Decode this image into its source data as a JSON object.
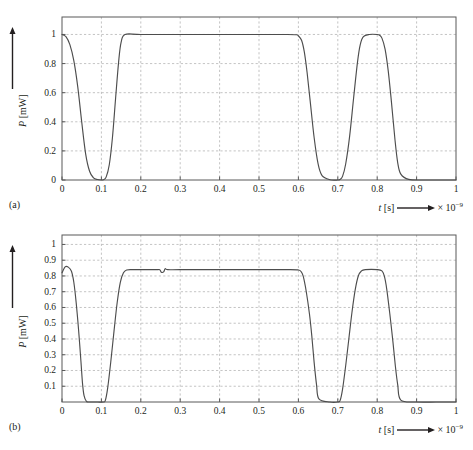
{
  "figure": {
    "background": "#ffffff",
    "line_color": "#4d4d4d",
    "axis_color": "#595959",
    "grid_color": "#aaaaaa"
  },
  "panels": [
    {
      "tag": "(a)",
      "xlabel_var": "t",
      "xlabel_unit": "[s]",
      "xlabel_scale_prefix": "× 10",
      "xlabel_scale_exp": "−9",
      "ylabel_var": "P",
      "ylabel_unit": "[mW]",
      "x_ticks": [
        "0",
        "0.1",
        "0.2",
        "0.3",
        "0.4",
        "0.5",
        "0.6",
        "0.7",
        "0.8",
        "0.9",
        "1"
      ],
      "y_ticks": [
        "0",
        "0.2",
        "0.4",
        "0.6",
        "0.8",
        "1"
      ]
    },
    {
      "tag": "(b)",
      "xlabel_var": "t",
      "xlabel_unit": "[s]",
      "xlabel_scale_prefix": "× 10",
      "xlabel_scale_exp": "−9",
      "ylabel_var": "P",
      "ylabel_unit": "[mW]",
      "x_ticks": [
        "0",
        "0.1",
        "0.2",
        "0.3",
        "0.4",
        "0.5",
        "0.6",
        "0.7",
        "0.8",
        "0.9",
        "1"
      ],
      "y_ticks": [
        "0.1",
        "0.2",
        "0.3",
        "0.4",
        "0.5",
        "0.6",
        "0.7",
        "0.8",
        "0.9",
        "1"
      ]
    }
  ],
  "chart_data": [
    {
      "type": "line",
      "title": "",
      "panel": "(a)",
      "xlabel": "t [s] × 10^-9",
      "ylabel": "P [mW]",
      "xlim": [
        0,
        1
      ],
      "ylim": [
        0,
        1.12
      ],
      "x_tick_values": [
        0,
        0.1,
        0.2,
        0.3,
        0.4,
        0.5,
        0.6,
        0.7,
        0.8,
        0.9,
        1
      ],
      "y_tick_values": [
        0,
        0.2,
        0.4,
        0.6,
        0.8,
        1
      ],
      "grid": true,
      "legend": "none",
      "series": [
        {
          "name": "optical power (a)",
          "x": [
            0.0,
            0.01,
            0.02,
            0.03,
            0.04,
            0.05,
            0.06,
            0.07,
            0.08,
            0.09,
            0.1,
            0.105,
            0.112,
            0.12,
            0.128,
            0.136,
            0.144,
            0.15,
            0.16,
            0.2,
            0.3,
            0.4,
            0.5,
            0.57,
            0.595,
            0.6,
            0.608,
            0.615,
            0.622,
            0.63,
            0.64,
            0.65,
            0.66,
            0.68,
            0.7,
            0.705,
            0.712,
            0.72,
            0.73,
            0.74,
            0.75,
            0.757,
            0.765,
            0.78,
            0.8,
            0.806,
            0.812,
            0.82,
            0.828,
            0.836,
            0.845,
            0.852,
            0.86,
            0.88,
            0.92,
            0.96,
            1.0
          ],
          "y": [
            1.0,
            0.985,
            0.93,
            0.82,
            0.64,
            0.4,
            0.18,
            0.06,
            0.015,
            0.003,
            0.0,
            0.002,
            0.02,
            0.105,
            0.29,
            0.56,
            0.82,
            0.945,
            1.0,
            1.0,
            1.0,
            1.0,
            1.0,
            1.0,
            0.998,
            0.99,
            0.96,
            0.88,
            0.74,
            0.54,
            0.29,
            0.11,
            0.03,
            0.002,
            0.0,
            0.003,
            0.025,
            0.11,
            0.3,
            0.56,
            0.81,
            0.93,
            0.985,
            1.0,
            1.0,
            0.995,
            0.975,
            0.9,
            0.75,
            0.54,
            0.28,
            0.12,
            0.04,
            0.004,
            0.0,
            0.0,
            0.0
          ]
        }
      ]
    },
    {
      "type": "line",
      "title": "",
      "panel": "(b)",
      "xlabel": "t [s] × 10^-9",
      "ylabel": "P [mW]",
      "xlim": [
        0,
        1
      ],
      "ylim": [
        0,
        1.06
      ],
      "x_tick_values": [
        0,
        0.1,
        0.2,
        0.3,
        0.4,
        0.5,
        0.6,
        0.7,
        0.8,
        0.9,
        1
      ],
      "y_tick_values": [
        0.1,
        0.2,
        0.3,
        0.4,
        0.5,
        0.6,
        0.7,
        0.8,
        0.9,
        1
      ],
      "grid": true,
      "legend": "none",
      "plateau_level": 0.84,
      "initial_overshoot": 0.86,
      "glitch_at_x": 0.25,
      "series": [
        {
          "name": "optical power (b)",
          "x": [
            0.0,
            0.008,
            0.016,
            0.024,
            0.03,
            0.036,
            0.042,
            0.048,
            0.052,
            0.056,
            0.062,
            0.07,
            0.09,
            0.105,
            0.11,
            0.116,
            0.124,
            0.132,
            0.14,
            0.148,
            0.156,
            0.164,
            0.18,
            0.2,
            0.24,
            0.248,
            0.252,
            0.258,
            0.262,
            0.268,
            0.3,
            0.4,
            0.5,
            0.58,
            0.6,
            0.606,
            0.612,
            0.62,
            0.628,
            0.634,
            0.64,
            0.646,
            0.652,
            0.68,
            0.7,
            0.706,
            0.712,
            0.72,
            0.728,
            0.736,
            0.744,
            0.752,
            0.76,
            0.77,
            0.8,
            0.812,
            0.818,
            0.824,
            0.832,
            0.84,
            0.846,
            0.852,
            0.86,
            0.9,
            0.95,
            1.0
          ],
          "y": [
            0.82,
            0.858,
            0.856,
            0.83,
            0.76,
            0.63,
            0.46,
            0.26,
            0.12,
            0.04,
            0.004,
            0.0,
            0.0,
            0.0,
            0.01,
            0.09,
            0.26,
            0.45,
            0.63,
            0.76,
            0.82,
            0.838,
            0.84,
            0.84,
            0.84,
            0.84,
            0.824,
            0.826,
            0.846,
            0.84,
            0.84,
            0.84,
            0.84,
            0.84,
            0.838,
            0.83,
            0.8,
            0.7,
            0.56,
            0.42,
            0.25,
            0.11,
            0.02,
            0.0,
            0.0,
            0.01,
            0.08,
            0.23,
            0.4,
            0.57,
            0.71,
            0.8,
            0.832,
            0.84,
            0.84,
            0.832,
            0.8,
            0.72,
            0.56,
            0.38,
            0.23,
            0.11,
            0.012,
            0.0,
            0.0,
            0.0
          ]
        }
      ]
    }
  ]
}
